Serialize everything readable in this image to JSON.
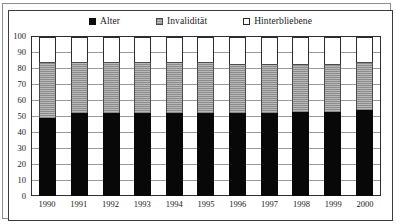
{
  "chart_data": {
    "type": "bar",
    "subtype": "stacked-column-100",
    "title": "",
    "xlabel": "",
    "ylabel": "",
    "ylim": [
      0,
      100
    ],
    "yticks": [
      100,
      90,
      80,
      70,
      60,
      50,
      40,
      30,
      20,
      10,
      0
    ],
    "grid": true,
    "legend_position": "top-center",
    "categories": [
      "1990",
      "1991",
      "1992",
      "1993",
      "1994",
      "1995",
      "1996",
      "1997",
      "1998",
      "1999",
      "2000"
    ],
    "series": [
      {
        "name": "Alter",
        "color": "#080808",
        "values": [
          49,
          52,
          52,
          52,
          52,
          52,
          52,
          52,
          53,
          53,
          54
        ]
      },
      {
        "name": "Invalidität",
        "color": "#a0a0a0",
        "values": [
          35,
          32,
          32,
          32,
          32,
          32,
          31,
          31,
          30,
          30,
          30
        ]
      },
      {
        "name": "Hinterbliebene",
        "color": "#ffffff",
        "values": [
          16,
          16,
          16,
          16,
          16,
          16,
          17,
          17,
          17,
          17,
          16
        ]
      }
    ]
  },
  "legend": {
    "items": [
      {
        "label": "Alter",
        "key": "filled-square-black"
      },
      {
        "label": "Invalidität",
        "key": "hatched-square-gray"
      },
      {
        "label": "Hinterbliebene",
        "key": "outlined-square-white"
      }
    ]
  }
}
